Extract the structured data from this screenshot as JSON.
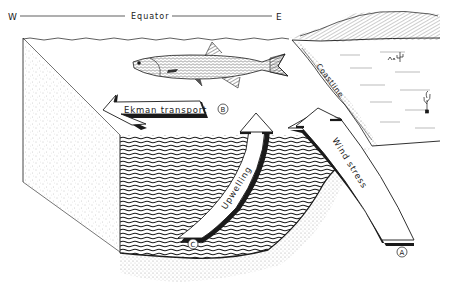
{
  "diagram": {
    "title_axis": {
      "west_label": "W",
      "equator_label": "Equator",
      "east_label": "E"
    },
    "labels": {
      "ekman_transport": "Ekman transport",
      "upwelling": "Upwelling",
      "wind_stress": "Wind stress",
      "coastline": "Coastline"
    },
    "markers": {
      "a": "A",
      "b": "B",
      "c": "C"
    },
    "colors": {
      "ink": "#1a1a1a",
      "paper": "#ffffff",
      "stipple": "#9a9a9a"
    }
  }
}
